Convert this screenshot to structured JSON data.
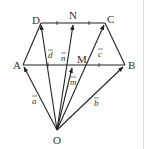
{
  "figure": {
    "type": "geometry-vector-diagram",
    "points": {
      "A": {
        "label": "A",
        "x": 23,
        "y": 65
      },
      "B": {
        "label": "B",
        "x": 125,
        "y": 65
      },
      "C": {
        "label": "C",
        "x": 105,
        "y": 23
      },
      "D": {
        "label": "D",
        "x": 41,
        "y": 23
      },
      "M": {
        "label": "M",
        "x": 73,
        "y": 65
      },
      "N": {
        "label": "N",
        "x": 73,
        "y": 23
      },
      "O": {
        "label": "O",
        "x": 57,
        "y": 130
      }
    },
    "vectors": [
      {
        "name": "a",
        "label": "a",
        "from": "O",
        "to": "A"
      },
      {
        "name": "b",
        "label": "b",
        "from": "O",
        "to": "B"
      },
      {
        "name": "c",
        "label": "c",
        "from": "O",
        "to": "C"
      },
      {
        "name": "d",
        "label": "d",
        "from": "O",
        "to": "D"
      },
      {
        "name": "m",
        "label": "m",
        "from": "O",
        "to": "M"
      },
      {
        "name": "n",
        "label": "n",
        "from": "O",
        "to": "N"
      }
    ],
    "segments": [
      "A-B",
      "D-C",
      "A-D",
      "B-C"
    ],
    "tick_marks": [
      "DN",
      "NC",
      "AM",
      "MB"
    ]
  }
}
